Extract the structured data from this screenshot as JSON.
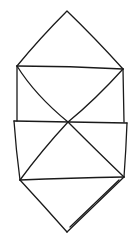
{
  "canvas": {
    "width": 140,
    "height": 239,
    "background": "#ffffff",
    "stroke": "#1a1a1a"
  },
  "drawing": {
    "subject": "hand-drawn line sketch of a folded origami-like shape (diamond top, two rectangular bands with X diagonals, diamond bottom)",
    "vertices": {
      "top": [
        67,
        11
      ],
      "upper_left": [
        17,
        66
      ],
      "upper_right": [
        123,
        69
      ],
      "center_cross": [
        68,
        122
      ],
      "band_top_left": [
        14,
        121
      ],
      "band_top_right": [
        127,
        123
      ],
      "lower_left": [
        20,
        180
      ],
      "lower_right": [
        124,
        177
      ],
      "bottom": [
        67,
        232
      ]
    }
  }
}
